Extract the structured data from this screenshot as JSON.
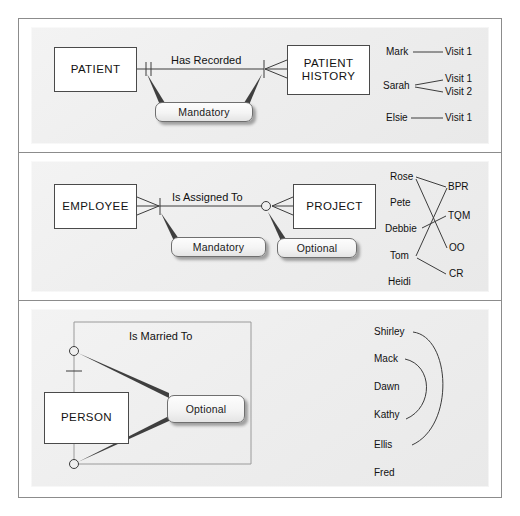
{
  "figure": {
    "border_color": "#8c8c8c",
    "panel_bg": "#eeeeee",
    "line_color": "#3c3c3c"
  },
  "panels": [
    {
      "id": "panel-mandatory-one-to-many",
      "entities": [
        {
          "name": "entity-patient",
          "label": "PATIENT"
        },
        {
          "name": "entity-patient-history",
          "label": "PATIENT\nHISTORY",
          "line1": "PATIENT",
          "line2": "HISTORY"
        }
      ],
      "relationship_label": "Has Recorded",
      "callouts": [
        {
          "name": "callout-mandatory",
          "label": "Mandatory"
        }
      ],
      "legend": {
        "left_items": [
          "Mark",
          "Sarah",
          "Elsie"
        ],
        "right_items": [
          "Visit 1",
          "Visit 1",
          "Visit 2",
          "Visit 1"
        ],
        "pairs": [
          {
            "from": "Mark",
            "to": "Visit 1"
          },
          {
            "from": "Sarah",
            "to": "Visit 1"
          },
          {
            "from": "Sarah",
            "to": "Visit 2"
          },
          {
            "from": "Elsie",
            "to": "Visit 1"
          }
        ]
      }
    },
    {
      "id": "panel-many-to-many",
      "entities": [
        {
          "name": "entity-employee",
          "label": "EMPLOYEE"
        },
        {
          "name": "entity-project",
          "label": "PROJECT"
        }
      ],
      "relationship_label": "Is Assigned To",
      "callouts": [
        {
          "name": "callout-mandatory",
          "label": "Mandatory"
        },
        {
          "name": "callout-optional",
          "label": "Optional"
        }
      ],
      "legend": {
        "left_items": [
          "Rose",
          "Pete",
          "Debbie",
          "Tom",
          "Heidi"
        ],
        "right_items": [
          "BPR",
          "TQM",
          "OO",
          "CR"
        ],
        "pairs": [
          {
            "from": "Rose",
            "to": "BPR"
          },
          {
            "from": "Rose",
            "to": "OO"
          },
          {
            "from": "Debbie",
            "to": "TQM"
          },
          {
            "from": "Tom",
            "to": "BPR"
          },
          {
            "from": "Tom",
            "to": "CR"
          }
        ]
      }
    },
    {
      "id": "panel-recursive-optional",
      "entities": [
        {
          "name": "entity-person",
          "label": "PERSON"
        }
      ],
      "relationship_label": "Is Married To",
      "callouts": [
        {
          "name": "callout-optional",
          "label": "Optional"
        }
      ],
      "legend": {
        "left_items": [
          "Shirley",
          "Mack",
          "Dawn",
          "Kathy",
          "Ellis",
          "Fred"
        ],
        "pairs": [
          {
            "from": "Shirley",
            "to": "Ellis"
          },
          {
            "from": "Mack",
            "to": "Kathy"
          }
        ]
      }
    }
  ]
}
